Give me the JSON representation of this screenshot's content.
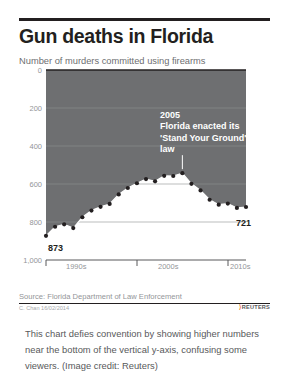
{
  "figure": {
    "title": "Gun deaths in Florida",
    "subtitle": "Number of murders committed using firearms",
    "source": "Source: Florida Department of Law Enforcement",
    "credit": "C. Chan 16/02/2014",
    "agency_mark": "REUTERS",
    "agency_glyph": "⟩"
  },
  "caption": {
    "text": "This chart defies convention by showing higher numbers near the bottom of the vertical y-axis, confusing some viewers. (Image credit: Reuters)"
  },
  "annotation": {
    "year": "2005",
    "body": "Florida enacted its 'Stand Your Ground' law"
  },
  "endpoints": {
    "start_label": "873",
    "end_label": "721"
  },
  "colors": {
    "fill": "#6e6f71",
    "line": "#ffffff",
    "marker": "#231f20",
    "title": "#231f20",
    "muted": "#939598",
    "accent": "#f37021"
  },
  "chart_data": {
    "type": "area",
    "title": "Gun deaths in Florida",
    "subtitle": "Number of murders committed using firearms",
    "xlabel": "",
    "ylabel": "Number of murders committed using firearms",
    "y_axis_inverted": true,
    "ylim": [
      0,
      1000
    ],
    "yticks": [
      0,
      200,
      400,
      600,
      800,
      1000
    ],
    "ytick_labels": [
      "0",
      "200",
      "400",
      "600",
      "800",
      "1,000"
    ],
    "xlim": [
      1990,
      2012
    ],
    "xticks": [
      1990,
      2000,
      2010
    ],
    "xtick_labels": [
      "1990s",
      "2000s",
      "2010s"
    ],
    "grid": true,
    "legend": null,
    "x": [
      1990,
      1991,
      1992,
      1993,
      1994,
      1995,
      1996,
      1997,
      1998,
      1999,
      2000,
      2001,
      2002,
      2003,
      2004,
      2005,
      2006,
      2007,
      2008,
      2009,
      2010,
      2011,
      2012
    ],
    "values": [
      873,
      825,
      812,
      832,
      775,
      740,
      720,
      705,
      655,
      621,
      596,
      574,
      586,
      557,
      558,
      543,
      599,
      634,
      683,
      709,
      703,
      726,
      721
    ],
    "annotations": [
      {
        "x": 2005,
        "text": "2005 Florida enacted its 'Stand Your Ground' law"
      },
      {
        "x": 1990,
        "text": "873"
      },
      {
        "x": 2012,
        "text": "721"
      }
    ]
  }
}
